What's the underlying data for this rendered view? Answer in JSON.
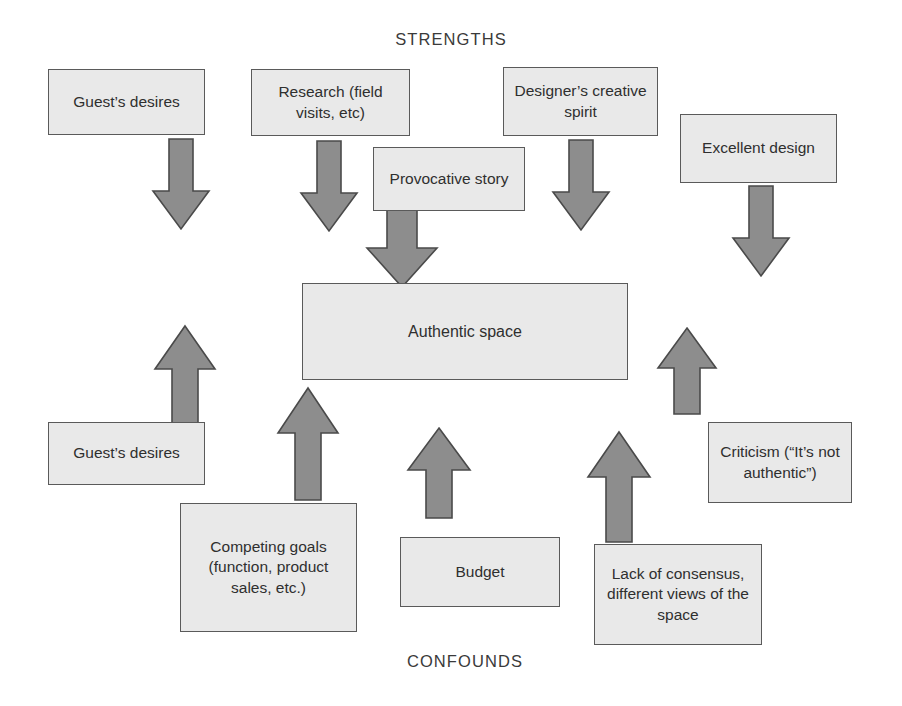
{
  "diagram": {
    "top_label": "STRENGTHS",
    "bottom_label": "CONFOUNDS",
    "center_node": "Authentic space",
    "colors": {
      "box_fill": "#e9e9e9",
      "box_border": "#5a5a5a",
      "arrow_fill": "#8d8d8d",
      "arrow_border": "#4a4a4a",
      "text": "#2f2f2f",
      "background": "#ffffff"
    },
    "strengths": [
      {
        "id": "guests-desires-top",
        "label": "Guest’s desires"
      },
      {
        "id": "research",
        "label": "Research (field visits, etc)"
      },
      {
        "id": "designers-creative-spirit",
        "label": "Designer’s creative spirit"
      },
      {
        "id": "excellent-design",
        "label": "Excellent design"
      },
      {
        "id": "provocative-story",
        "label": "Provocative story"
      }
    ],
    "confounds": [
      {
        "id": "guests-desires-bottom",
        "label": "Guest’s desires"
      },
      {
        "id": "competing-goals",
        "label": "Competing goals (function, product sales, etc.)"
      },
      {
        "id": "budget",
        "label": "Budget"
      },
      {
        "id": "lack-of-consensus",
        "label": "Lack of consensus, different views of the space"
      },
      {
        "id": "criticism",
        "label": "Criticism (“It’s not authentic”)"
      }
    ],
    "arrows": [
      {
        "id": "arrow-guests-desires-top-down",
        "direction": "down"
      },
      {
        "id": "arrow-research-down",
        "direction": "down"
      },
      {
        "id": "arrow-provocative-story-down",
        "direction": "down"
      },
      {
        "id": "arrow-designers-spirit-down",
        "direction": "down"
      },
      {
        "id": "arrow-excellent-design-down",
        "direction": "down"
      },
      {
        "id": "arrow-guests-desires-bottom-up",
        "direction": "up"
      },
      {
        "id": "arrow-competing-goals-up",
        "direction": "up"
      },
      {
        "id": "arrow-budget-up",
        "direction": "up"
      },
      {
        "id": "arrow-lack-of-consensus-up",
        "direction": "up"
      },
      {
        "id": "arrow-criticism-up",
        "direction": "up"
      }
    ]
  }
}
